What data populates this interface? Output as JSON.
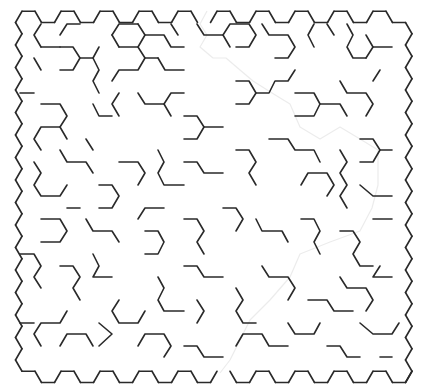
{
  "maze": {
    "type": "hexagonal",
    "cols": 20,
    "rows": 16,
    "cell_side": 13,
    "col_step": 19.5,
    "row_step": 22.5,
    "origin": {
      "x": 28.5,
      "y": 22.5
    },
    "wall_color": "#2a2a2a",
    "ghost_color": "#ececec",
    "entrance": {
      "col": 9,
      "side": "top"
    },
    "exit": {
      "col": 10,
      "side": "bottom"
    },
    "interior_walls": [
      [
        [
          80,
          24
        ],
        [
          67,
          24
        ],
        [
          60,
          35
        ]
      ],
      [
        [
          60,
          47
        ],
        [
          73,
          47
        ],
        [
          80,
          58
        ],
        [
          73,
          70
        ],
        [
          60,
          70
        ]
      ],
      [
        [
          41,
          47
        ],
        [
          34,
          35
        ],
        [
          41,
          24
        ]
      ],
      [
        [
          34,
          58
        ],
        [
          41,
          70
        ]
      ],
      [
        [
          60,
          47
        ],
        [
          41,
          47
        ]
      ],
      [
        [
          93,
          58
        ],
        [
          80,
          58
        ]
      ],
      [
        [
          99,
          47
        ],
        [
          93,
          58
        ],
        [
          99,
          70
        ],
        [
          93,
          81
        ],
        [
          99,
          93
        ]
      ],
      [
        [
          112,
          35
        ],
        [
          119,
          24
        ],
        [
          138,
          24
        ]
      ],
      [
        [
          119,
          47
        ],
        [
          112,
          35
        ]
      ],
      [
        [
          119,
          47
        ],
        [
          138,
          47
        ],
        [
          145,
          58
        ],
        [
          138,
          70
        ],
        [
          119,
          70
        ],
        [
          112,
          81
        ]
      ],
      [
        [
          138,
          47
        ],
        [
          145,
          35
        ]
      ],
      [
        [
          158,
          58
        ],
        [
          165,
          70
        ],
        [
          184,
          70
        ]
      ],
      [
        [
          145,
          58
        ],
        [
          158,
          58
        ]
      ],
      [
        [
          138,
          24
        ],
        [
          145,
          35
        ],
        [
          164,
          35
        ],
        [
          171,
          47
        ],
        [
          184,
          47
        ]
      ],
      [
        [
          171,
          24
        ],
        [
          178,
          35
        ]
      ],
      [
        [
          197,
          24
        ],
        [
          204,
          35
        ],
        [
          223,
          35
        ],
        [
          230,
          47
        ]
      ],
      [
        [
          223,
          35
        ],
        [
          230,
          24
        ],
        [
          249,
          24
        ],
        [
          256,
          35
        ],
        [
          249,
          47
        ],
        [
          236,
          47
        ]
      ],
      [
        [
          262,
          24
        ],
        [
          269,
          35
        ],
        [
          288,
          35
        ],
        [
          295,
          47
        ],
        [
          288,
          58
        ],
        [
          275,
          58
        ]
      ],
      [
        [
          314,
          24
        ],
        [
          308,
          35
        ],
        [
          314,
          47
        ]
      ],
      [
        [
          327,
          24
        ],
        [
          334,
          35
        ]
      ],
      [
        [
          347,
          24
        ],
        [
          353,
          35
        ],
        [
          347,
          47
        ],
        [
          353,
          58
        ],
        [
          366,
          58
        ]
      ],
      [
        [
          366,
          35
        ],
        [
          373,
          47
        ],
        [
          366,
          58
        ]
      ],
      [
        [
          373,
          47
        ],
        [
          392,
          47
        ]
      ],
      [
        [
          20,
          93
        ],
        [
          34,
          93
        ]
      ],
      [
        [
          41,
          104
        ],
        [
          60,
          104
        ],
        [
          67,
          116
        ],
        [
          60,
          127
        ],
        [
          41,
          127
        ],
        [
          34,
          139
        ],
        [
          41,
          150
        ]
      ],
      [
        [
          60,
          127
        ],
        [
          67,
          139
        ]
      ],
      [
        [
          93,
          104
        ],
        [
          99,
          116
        ],
        [
          112,
          116
        ]
      ],
      [
        [
          119,
          93
        ],
        [
          112,
          104
        ],
        [
          119,
          116
        ]
      ],
      [
        [
          138,
          93
        ],
        [
          145,
          104
        ],
        [
          164,
          104
        ],
        [
          171,
          116
        ]
      ],
      [
        [
          164,
          104
        ],
        [
          171,
          93
        ],
        [
          184,
          93
        ]
      ],
      [
        [
          184,
          116
        ],
        [
          197,
          116
        ],
        [
          204,
          127
        ],
        [
          197,
          139
        ],
        [
          184,
          139
        ]
      ],
      [
        [
          204,
          127
        ],
        [
          223,
          127
        ]
      ],
      [
        [
          236,
          81
        ],
        [
          249,
          81
        ],
        [
          256,
          93
        ],
        [
          249,
          104
        ],
        [
          236,
          104
        ]
      ],
      [
        [
          256,
          93
        ],
        [
          269,
          93
        ],
        [
          275,
          81
        ],
        [
          288,
          81
        ],
        [
          295,
          70
        ]
      ],
      [
        [
          295,
          93
        ],
        [
          314,
          93
        ],
        [
          320,
          104
        ],
        [
          314,
          116
        ],
        [
          295,
          116
        ]
      ],
      [
        [
          320,
          104
        ],
        [
          340,
          104
        ],
        [
          347,
          116
        ]
      ],
      [
        [
          340,
          81
        ],
        [
          347,
          93
        ],
        [
          366,
          93
        ],
        [
          373,
          104
        ],
        [
          366,
          116
        ]
      ],
      [
        [
          373,
          81
        ],
        [
          380,
          70
        ]
      ],
      [
        [
          360,
          139
        ],
        [
          373,
          139
        ],
        [
          380,
          150
        ],
        [
          373,
          162
        ],
        [
          360,
          162
        ]
      ],
      [
        [
          380,
          150
        ],
        [
          392,
          150
        ]
      ],
      [
        [
          34,
          162
        ],
        [
          41,
          173
        ],
        [
          34,
          185
        ],
        [
          41,
          196
        ],
        [
          60,
          196
        ],
        [
          67,
          185
        ]
      ],
      [
        [
          60,
          150
        ],
        [
          67,
          162
        ],
        [
          86,
          162
        ],
        [
          93,
          173
        ]
      ],
      [
        [
          86,
          139
        ],
        [
          93,
          150
        ]
      ],
      [
        [
          99,
          185
        ],
        [
          112,
          185
        ],
        [
          119,
          196
        ],
        [
          112,
          208
        ],
        [
          99,
          208
        ]
      ],
      [
        [
          119,
          162
        ],
        [
          138,
          162
        ],
        [
          145,
          173
        ],
        [
          138,
          185
        ]
      ],
      [
        [
          158,
          150
        ],
        [
          164,
          162
        ],
        [
          158,
          173
        ],
        [
          164,
          185
        ],
        [
          184,
          185
        ]
      ],
      [
        [
          184,
          162
        ],
        [
          197,
          162
        ],
        [
          204,
          173
        ],
        [
          223,
          173
        ]
      ],
      [
        [
          236,
          150
        ],
        [
          249,
          150
        ],
        [
          256,
          162
        ],
        [
          249,
          173
        ],
        [
          256,
          185
        ]
      ],
      [
        [
          269,
          139
        ],
        [
          288,
          139
        ],
        [
          295,
          150
        ],
        [
          314,
          150
        ],
        [
          320,
          162
        ]
      ],
      [
        [
          301,
          185
        ],
        [
          308,
          173
        ],
        [
          327,
          173
        ],
        [
          334,
          185
        ],
        [
          327,
          196
        ]
      ],
      [
        [
          340,
          150
        ],
        [
          347,
          162
        ],
        [
          340,
          173
        ],
        [
          347,
          185
        ],
        [
          340,
          196
        ],
        [
          347,
          208
        ]
      ],
      [
        [
          360,
          185
        ],
        [
          373,
          196
        ],
        [
          392,
          196
        ]
      ],
      [
        [
          41,
          219
        ],
        [
          60,
          219
        ],
        [
          67,
          231
        ],
        [
          60,
          242
        ],
        [
          41,
          242
        ]
      ],
      [
        [
          67,
          208
        ],
        [
          80,
          208
        ]
      ],
      [
        [
          86,
          219
        ],
        [
          93,
          231
        ],
        [
          112,
          231
        ],
        [
          119,
          242
        ]
      ],
      [
        [
          138,
          219
        ],
        [
          145,
          208
        ],
        [
          164,
          208
        ]
      ],
      [
        [
          145,
          231
        ],
        [
          158,
          231
        ],
        [
          164,
          242
        ],
        [
          158,
          254
        ],
        [
          145,
          254
        ]
      ],
      [
        [
          184,
          219
        ],
        [
          197,
          219
        ],
        [
          204,
          231
        ],
        [
          197,
          242
        ],
        [
          204,
          254
        ]
      ],
      [
        [
          223,
          208
        ],
        [
          236,
          208
        ],
        [
          243,
          219
        ],
        [
          236,
          231
        ]
      ],
      [
        [
          256,
          219
        ],
        [
          262,
          231
        ],
        [
          282,
          231
        ],
        [
          288,
          242
        ]
      ],
      [
        [
          301,
          219
        ],
        [
          314,
          219
        ],
        [
          320,
          231
        ],
        [
          314,
          242
        ],
        [
          320,
          254
        ]
      ],
      [
        [
          340,
          231
        ],
        [
          353,
          231
        ],
        [
          360,
          242
        ],
        [
          353,
          254
        ],
        [
          360,
          266
        ],
        [
          373,
          266
        ]
      ],
      [
        [
          373,
          219
        ],
        [
          392,
          219
        ]
      ],
      [
        [
          20,
          254
        ],
        [
          34,
          254
        ],
        [
          41,
          266
        ],
        [
          34,
          277
        ],
        [
          41,
          288
        ]
      ],
      [
        [
          60,
          266
        ],
        [
          73,
          266
        ],
        [
          80,
          277
        ],
        [
          73,
          288
        ],
        [
          80,
          300
        ]
      ],
      [
        [
          93,
          254
        ],
        [
          99,
          266
        ],
        [
          93,
          277
        ],
        [
          112,
          277
        ]
      ],
      [
        [
          119,
          300
        ],
        [
          112,
          311
        ],
        [
          119,
          323
        ],
        [
          138,
          323
        ],
        [
          145,
          311
        ]
      ],
      [
        [
          158,
          277
        ],
        [
          164,
          288
        ],
        [
          158,
          300
        ],
        [
          164,
          311
        ],
        [
          184,
          311
        ]
      ],
      [
        [
          184,
          266
        ],
        [
          197,
          266
        ],
        [
          204,
          277
        ],
        [
          223,
          277
        ]
      ],
      [
        [
          197,
          300
        ],
        [
          204,
          311
        ],
        [
          197,
          323
        ]
      ],
      [
        [
          236,
          288
        ],
        [
          243,
          300
        ],
        [
          236,
          311
        ],
        [
          243,
          323
        ],
        [
          256,
          323
        ]
      ],
      [
        [
          262,
          266
        ],
        [
          269,
          277
        ],
        [
          288,
          277
        ],
        [
          295,
          288
        ],
        [
          288,
          300
        ]
      ],
      [
        [
          308,
          300
        ],
        [
          327,
          300
        ],
        [
          334,
          311
        ],
        [
          353,
          311
        ]
      ],
      [
        [
          340,
          277
        ],
        [
          347,
          288
        ],
        [
          366,
          288
        ],
        [
          373,
          300
        ],
        [
          366,
          311
        ]
      ],
      [
        [
          380,
          266
        ],
        [
          373,
          277
        ],
        [
          392,
          277
        ]
      ],
      [
        [
          20,
          323
        ],
        [
          34,
          323
        ]
      ],
      [
        [
          41,
          346
        ],
        [
          34,
          334
        ],
        [
          41,
          323
        ],
        [
          60,
          323
        ],
        [
          67,
          311
        ]
      ],
      [
        [
          60,
          346
        ],
        [
          67,
          334
        ],
        [
          86,
          334
        ],
        [
          93,
          346
        ]
      ],
      [
        [
          99,
          323
        ],
        [
          112,
          334
        ],
        [
          99,
          346
        ]
      ],
      [
        [
          138,
          346
        ],
        [
          145,
          334
        ],
        [
          164,
          334
        ],
        [
          171,
          346
        ],
        [
          164,
          357
        ]
      ],
      [
        [
          184,
          346
        ],
        [
          197,
          346
        ],
        [
          204,
          357
        ],
        [
          223,
          357
        ]
      ],
      [
        [
          236,
          346
        ],
        [
          243,
          334
        ],
        [
          262,
          334
        ],
        [
          269,
          346
        ],
        [
          288,
          346
        ]
      ],
      [
        [
          288,
          323
        ],
        [
          295,
          334
        ],
        [
          314,
          334
        ],
        [
          320,
          323
        ]
      ],
      [
        [
          327,
          346
        ],
        [
          340,
          346
        ],
        [
          347,
          357
        ],
        [
          360,
          357
        ]
      ],
      [
        [
          360,
          323
        ],
        [
          373,
          334
        ],
        [
          392,
          334
        ],
        [
          399,
          323
        ]
      ],
      [
        [
          380,
          357
        ],
        [
          392,
          357
        ]
      ]
    ],
    "ghost_path": [
      [
        207,
        11
      ],
      [
        200,
        24
      ],
      [
        207,
        35
      ],
      [
        200,
        47
      ],
      [
        213,
        58
      ],
      [
        226,
        58
      ],
      [
        240,
        70
      ],
      [
        253,
        81
      ],
      [
        272,
        93
      ],
      [
        290,
        104
      ],
      [
        300,
        127
      ],
      [
        320,
        139
      ],
      [
        340,
        127
      ],
      [
        360,
        139
      ],
      [
        378,
        150
      ],
      [
        378,
        185
      ],
      [
        372,
        208
      ],
      [
        360,
        231
      ],
      [
        330,
        242
      ],
      [
        300,
        254
      ],
      [
        290,
        277
      ],
      [
        270,
        300
      ],
      [
        250,
        320
      ],
      [
        240,
        340
      ],
      [
        230,
        360
      ],
      [
        220,
        373
      ]
    ]
  }
}
